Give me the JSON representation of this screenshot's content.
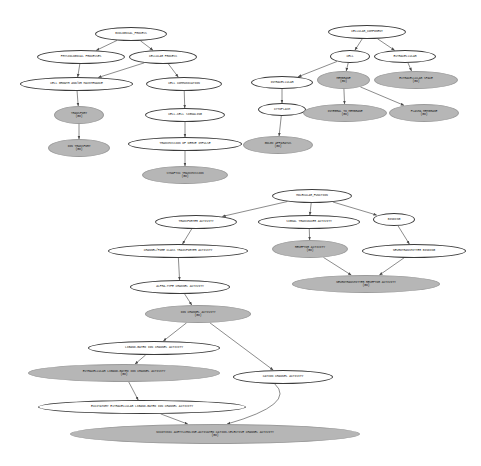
{
  "figure": {
    "type": "gene-ontology-dag",
    "background": "#ffffff",
    "node_fill_shaded": "#b6b6b6",
    "node_fill_plain": "#ffffff",
    "node_stroke": "#3b3b3b",
    "edge_color": "#6e6e6e"
  },
  "nodes": [
    {
      "id": "bio_process",
      "label": "BIOLOGICAL_PROCESS",
      "goid": "",
      "shaded": false,
      "x": 95,
      "y": 27,
      "w": 72,
      "h": 14,
      "fs": 3.1
    },
    {
      "id": "phys_processes",
      "label": "PHYSIOLOGICAL PROCESSES",
      "goid": "",
      "shaded": false,
      "x": 37,
      "y": 50,
      "w": 88,
      "h": 14,
      "fs": 3.1
    },
    {
      "id": "cellular_process",
      "label": "CELLULAR PROCESS",
      "goid": "",
      "shaded": false,
      "x": 129,
      "y": 50,
      "w": 68,
      "h": 14,
      "fs": 3.1
    },
    {
      "id": "cell_growth",
      "label": "CELL GROWTH AND/OR MAINTENANCE",
      "goid": "",
      "shaded": false,
      "x": 20,
      "y": 77,
      "w": 113,
      "h": 14,
      "fs": 3.1
    },
    {
      "id": "cell_comm",
      "label": "CELL COMMUNICATION",
      "goid": "",
      "shaded": false,
      "x": 146,
      "y": 77,
      "w": 76,
      "h": 14,
      "fs": 3.1
    },
    {
      "id": "transport",
      "label": "TRANSPORT",
      "goid": "(GO)",
      "shaded": true,
      "x": 54,
      "y": 106,
      "w": 50,
      "h": 18,
      "fs": 3.1
    },
    {
      "id": "ion_transport",
      "label": "ION TRANSPORT",
      "goid": "(GO)",
      "shaded": true,
      "x": 48,
      "y": 139,
      "w": 62,
      "h": 18,
      "fs": 3.1
    },
    {
      "id": "cell_cell_sig",
      "label": "CELL-CELL SIGNALING",
      "goid": "",
      "shaded": false,
      "x": 145,
      "y": 108,
      "w": 80,
      "h": 14,
      "fs": 3.1
    },
    {
      "id": "nerve_impulse",
      "label": "TRANSMISSION OF NERVE IMPULSE",
      "goid": "",
      "shaded": false,
      "x": 128,
      "y": 137,
      "w": 114,
      "h": 14,
      "fs": 3.1
    },
    {
      "id": "synaptic_trans",
      "label": "SYNAPTIC TRANSMISSION",
      "goid": "(GO)",
      "shaded": true,
      "x": 142,
      "y": 166,
      "w": 86,
      "h": 18,
      "fs": 3.1
    },
    {
      "id": "cell_component",
      "label": "CELLULAR_COMPONENT",
      "goid": "",
      "shaded": false,
      "x": 328,
      "y": 25,
      "w": 78,
      "h": 14,
      "fs": 3.1
    },
    {
      "id": "cell",
      "label": "CELL",
      "goid": "",
      "shaded": false,
      "x": 330,
      "y": 50,
      "w": 40,
      "h": 13,
      "fs": 3.1
    },
    {
      "id": "extracellular",
      "label": "EXTRACELLULAR",
      "goid": "",
      "shaded": false,
      "x": 374,
      "y": 50,
      "w": 62,
      "h": 13,
      "fs": 3.1
    },
    {
      "id": "intracellular",
      "label": "INTRACELLULAR",
      "goid": "",
      "shaded": false,
      "x": 251,
      "y": 76,
      "w": 62,
      "h": 13,
      "fs": 3.1
    },
    {
      "id": "membrane",
      "label": "MEMBRANE",
      "goid": "(GO)",
      "shaded": true,
      "x": 317,
      "y": 71,
      "w": 53,
      "h": 18,
      "fs": 3.1
    },
    {
      "id": "extracell_space",
      "label": "EXTRACELLULAR SPACE",
      "goid": "(GO)",
      "shaded": true,
      "x": 374,
      "y": 71,
      "w": 84,
      "h": 18,
      "fs": 3.1
    },
    {
      "id": "cytoplasm",
      "label": "CYTOPLASM",
      "goid": "",
      "shaded": false,
      "x": 258,
      "y": 103,
      "w": 48,
      "h": 13,
      "fs": 3.1
    },
    {
      "id": "integral_membrane",
      "label": "INTEGRAL TO MEMBRANE",
      "goid": "(GO)",
      "shaded": true,
      "x": 303,
      "y": 104,
      "w": 84,
      "h": 18,
      "fs": 3.1
    },
    {
      "id": "plasma_membrane",
      "label": "PLASMA MEMBRANE",
      "goid": "(GO)",
      "shaded": true,
      "x": 389,
      "y": 104,
      "w": 70,
      "h": 18,
      "fs": 3.1
    },
    {
      "id": "golgi",
      "label": "GOLGI APPARATUS",
      "goid": "(GO)",
      "shaded": true,
      "x": 243,
      "y": 136,
      "w": 70,
      "h": 18,
      "fs": 3.1
    },
    {
      "id": "mol_function",
      "label": "MOLECULAR_FUNCTION",
      "goid": "",
      "shaded": false,
      "x": 272,
      "y": 189,
      "w": 80,
      "h": 14,
      "fs": 3.1
    },
    {
      "id": "transporter_act",
      "label": "TRANSPORTER ACTIVITY",
      "goid": "",
      "shaded": false,
      "x": 155,
      "y": 215,
      "w": 82,
      "h": 14,
      "fs": 3.1
    },
    {
      "id": "signal_trans_act",
      "label": "SIGNAL TRANSDUCER ACTIVITY",
      "goid": "",
      "shaded": false,
      "x": 258,
      "y": 215,
      "w": 102,
      "h": 14,
      "fs": 3.1
    },
    {
      "id": "binding",
      "label": "BINDING",
      "goid": "",
      "shaded": false,
      "x": 373,
      "y": 213,
      "w": 42,
      "h": 13,
      "fs": 3.1
    },
    {
      "id": "channel_pore",
      "label": "CHANNEL/PORE CLASS TRANSPORTER ACTIVITY",
      "goid": "",
      "shaded": false,
      "x": 108,
      "y": 244,
      "w": 140,
      "h": 14,
      "fs": 3.1
    },
    {
      "id": "receptor_act",
      "label": "RECEPTOR ACTIVITY",
      "goid": "(GO)",
      "shaded": true,
      "x": 272,
      "y": 240,
      "w": 76,
      "h": 18,
      "fs": 3.1
    },
    {
      "id": "neurotrans_binding",
      "label": "NEUROTRANSMITTER BINDING",
      "goid": "",
      "shaded": false,
      "x": 362,
      "y": 244,
      "w": 104,
      "h": 14,
      "fs": 3.1
    },
    {
      "id": "alpha_channel",
      "label": "ALPHA-TYPE CHANNEL ACTIVITY",
      "goid": "",
      "shaded": false,
      "x": 130,
      "y": 280,
      "w": 100,
      "h": 14,
      "fs": 3.1
    },
    {
      "id": "neurotrans_receptor",
      "label": "NEUROTRANSMITTER RECEPTOR ACTIVITY",
      "goid": "(GO)",
      "shaded": true,
      "x": 292,
      "y": 275,
      "w": 148,
      "h": 18,
      "fs": 3.1
    },
    {
      "id": "ion_channel_act",
      "label": "ION CHANNEL ACTIVITY",
      "goid": "(GO)",
      "shaded": true,
      "x": 145,
      "y": 305,
      "w": 106,
      "h": 18,
      "fs": 3.1
    },
    {
      "id": "ligand_gated",
      "label": "LIGAND-GATED ION CHANNEL ACTIVITY",
      "goid": "",
      "shaded": false,
      "x": 88,
      "y": 341,
      "w": 132,
      "h": 14,
      "fs": 3.1
    },
    {
      "id": "cation_channel",
      "label": "CATION CHANNEL ACTIVITY",
      "goid": "",
      "shaded": false,
      "x": 233,
      "y": 370,
      "w": 100,
      "h": 14,
      "fs": 3.1
    },
    {
      "id": "extracell_ligand",
      "label": "EXTRACELLULAR LIGAND-GATED ION CHANNEL ACTIVITY",
      "goid": "(GO)",
      "shaded": true,
      "x": 28,
      "y": 364,
      "w": 192,
      "h": 18,
      "fs": 3.1
    },
    {
      "id": "excitatory",
      "label": "EXCITATORY EXTRACELLULAR LIGAND-GATED ION CHANNEL ACTIVITY",
      "goid": "",
      "shaded": false,
      "x": 38,
      "y": 400,
      "w": 208,
      "h": 14,
      "fs": 3.1
    },
    {
      "id": "nicotinic",
      "label": "NICOTINIC ACETYLCHOLINE-ACTIVATED CATION-SELECTIVE CHANNEL ACTIVITY",
      "goid": "(GO)",
      "shaded": true,
      "x": 70,
      "y": 424,
      "w": 290,
      "h": 20,
      "fs": 3.1
    }
  ],
  "edges": [
    {
      "from": "bio_process",
      "to": "phys_processes"
    },
    {
      "from": "bio_process",
      "to": "cellular_process"
    },
    {
      "from": "phys_processes",
      "to": "cell_growth"
    },
    {
      "from": "cellular_process",
      "to": "cell_growth"
    },
    {
      "from": "cellular_process",
      "to": "cell_comm"
    },
    {
      "from": "cell_growth",
      "to": "transport"
    },
    {
      "from": "transport",
      "to": "ion_transport"
    },
    {
      "from": "cell_comm",
      "to": "cell_cell_sig"
    },
    {
      "from": "cell_cell_sig",
      "to": "nerve_impulse"
    },
    {
      "from": "nerve_impulse",
      "to": "synaptic_trans"
    },
    {
      "from": "cell_component",
      "to": "cell"
    },
    {
      "from": "cell_component",
      "to": "extracellular"
    },
    {
      "from": "cell",
      "to": "intracellular"
    },
    {
      "from": "cell",
      "to": "membrane"
    },
    {
      "from": "extracellular",
      "to": "extracell_space"
    },
    {
      "from": "intracellular",
      "to": "cytoplasm"
    },
    {
      "from": "cytoplasm",
      "to": "golgi"
    },
    {
      "from": "membrane",
      "to": "integral_membrane"
    },
    {
      "from": "membrane",
      "to": "plasma_membrane"
    },
    {
      "from": "mol_function",
      "to": "transporter_act"
    },
    {
      "from": "mol_function",
      "to": "signal_trans_act"
    },
    {
      "from": "mol_function",
      "to": "binding"
    },
    {
      "from": "transporter_act",
      "to": "channel_pore"
    },
    {
      "from": "signal_trans_act",
      "to": "receptor_act"
    },
    {
      "from": "binding",
      "to": "neurotrans_binding"
    },
    {
      "from": "channel_pore",
      "to": "alpha_channel"
    },
    {
      "from": "receptor_act",
      "to": "neurotrans_receptor"
    },
    {
      "from": "neurotrans_binding",
      "to": "neurotrans_receptor"
    },
    {
      "from": "alpha_channel",
      "to": "ion_channel_act"
    },
    {
      "from": "ion_channel_act",
      "to": "ligand_gated"
    },
    {
      "from": "ion_channel_act",
      "to": "cation_channel"
    },
    {
      "from": "ligand_gated",
      "to": "extracell_ligand"
    },
    {
      "from": "extracell_ligand",
      "to": "excitatory"
    },
    {
      "from": "excitatory",
      "to": "nicotinic"
    },
    {
      "from": "cation_channel",
      "to": "nicotinic",
      "curved": true
    }
  ]
}
